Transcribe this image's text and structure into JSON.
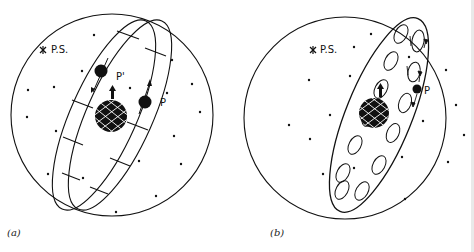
{
  "figure": {
    "panels": [
      {
        "id": "a",
        "caption": "(a)",
        "labels": {
          "pole_star": "P.S.",
          "planet": "P",
          "planet_prime": "P'"
        },
        "description": "Celestial sphere with tilted ring band (rectangular segments) around central Earth; planet P and P' on band with motion arrows; stars scattered"
      },
      {
        "id": "b",
        "caption": "(b)",
        "labels": {
          "pole_star": "P.S.",
          "planet": "P"
        },
        "description": "Celestial sphere with tilted ellipse containing epicycle loops around central Earth; planet P on epicycle with arrows; stars scattered"
      }
    ],
    "colors": {
      "ink": "#111111",
      "background": "#ffffff",
      "edge_strip": "#e9e9e9"
    }
  }
}
